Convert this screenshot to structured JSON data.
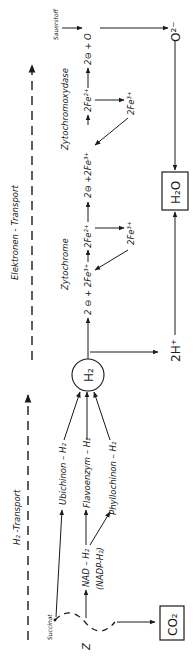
{
  "orientation": "rotated-90-ccw",
  "sections": {
    "h2_transport": "H₂ -Transport",
    "electron_transport": "Elektronen - Transport"
  },
  "substrates": {
    "succinat": "Succinat",
    "z": "Z",
    "nad": "NAD – H₂",
    "nadp": "(NADP-H₂)",
    "co2": "CO₂"
  },
  "carriers": {
    "ubichinon": "Ubichinon – H₂",
    "flavoenzym": "Flavoenzym – H₂",
    "phyllochinon": "Phyllochinon – H₂",
    "h2": "H₂"
  },
  "products": {
    "protons": "2H⁺",
    "water": "H₂O"
  },
  "cytochrome": {
    "label": "Zytochrome",
    "electrons": "2 ⊖ + 2Fe³⁺",
    "fe2": "2Fe²⁺",
    "fe3": "2Fe³⁺"
  },
  "cytochromoxydase": {
    "label": "Zytochromoxydase",
    "electrons": "2⊖ +2Fe³⁺",
    "fe2": "2Fe²⁺",
    "fe3": "2Fe³⁺"
  },
  "oxygen": {
    "label": "Sauerstoff",
    "electrons_plus_o": "2⊖ + O",
    "oxide": "O²⁻"
  }
}
